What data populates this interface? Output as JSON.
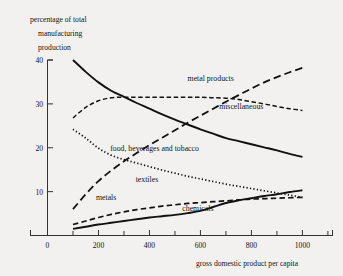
{
  "chart_data": {
    "type": "line",
    "title": "percentage of total manufacturing production",
    "title_lines": [
      "percentage of total",
      "manufacturing",
      "production"
    ],
    "xlabel": "gross domestic product per capita",
    "ylabel": "percentage of total manufacturing production",
    "xlim": [
      0,
      1120
    ],
    "ylim": [
      0,
      40
    ],
    "grid": false,
    "legend_position": "inline-annotations",
    "xticks": [
      0,
      200,
      400,
      600,
      800,
      1000
    ],
    "xtick_labels": [
      "0",
      "200",
      "400",
      "600",
      "800",
      "1000"
    ],
    "xminor_ticks": [
      100,
      300,
      500,
      700,
      900,
      1100
    ],
    "yticks": [
      0,
      10,
      20,
      30,
      40
    ],
    "ytick_labels": [
      "0",
      "10",
      "20",
      "30",
      "40"
    ],
    "x": [
      100,
      150,
      200,
      250,
      300,
      350,
      400,
      450,
      500,
      550,
      600,
      650,
      700,
      750,
      800,
      850,
      900,
      950,
      1000
    ],
    "series": [
      {
        "name": "food, beverages and tobacco",
        "label": "food, beverages and tobacco",
        "style": "solid",
        "values": [
          40.0,
          37.3,
          34.9,
          33.0,
          31.6,
          30.2,
          28.9,
          27.6,
          26.4,
          25.3,
          24.2,
          23.2,
          22.2,
          21.5,
          20.8,
          20.1,
          19.4,
          18.6,
          17.9
        ]
      },
      {
        "name": "miscellaneous",
        "label": "miscellaneous",
        "style": "dashed",
        "values": [
          26.8,
          29.2,
          30.7,
          31.4,
          31.5,
          31.5,
          31.5,
          31.5,
          31.5,
          31.5,
          31.5,
          31.4,
          31.3,
          31.0,
          30.5,
          30.0,
          29.4,
          28.9,
          28.5
        ]
      },
      {
        "name": "metal products",
        "label": "metal products",
        "style": "long-dash",
        "values": [
          6.0,
          9.4,
          12.4,
          14.8,
          16.9,
          18.8,
          20.6,
          22.3,
          24.0,
          25.7,
          27.3,
          28.9,
          30.5,
          32.0,
          33.5,
          34.9,
          36.1,
          37.2,
          38.2
        ]
      },
      {
        "name": "textiles",
        "label": "textiles",
        "style": "dotted",
        "values": [
          24.2,
          22.2,
          19.9,
          18.3,
          17.3,
          16.5,
          15.7,
          14.9,
          14.2,
          13.5,
          12.9,
          12.3,
          11.7,
          11.2,
          10.7,
          10.2,
          9.7,
          9.2,
          8.7
        ]
      },
      {
        "name": "metals",
        "label": "metals",
        "style": "medium-dash",
        "values": [
          2.5,
          3.3,
          4.1,
          4.8,
          5.4,
          5.9,
          6.3,
          6.7,
          7.0,
          7.3,
          7.5,
          7.7,
          7.9,
          8.1,
          8.3,
          8.4,
          8.5,
          8.6,
          8.7
        ]
      },
      {
        "name": "chemicals",
        "label": "chemicals",
        "style": "solid",
        "values": [
          1.5,
          2.0,
          2.5,
          2.9,
          3.3,
          3.7,
          4.1,
          4.4,
          4.7,
          5.1,
          5.6,
          6.5,
          7.4,
          8.0,
          8.5,
          9.0,
          9.4,
          9.9,
          10.3
        ]
      }
    ],
    "annotations": [
      {
        "text": "metal products",
        "x": 640,
        "y": 35.2
      },
      {
        "text": "miscellaneous",
        "x": 760,
        "y": 28.9
      },
      {
        "text": "food, beverages and tobacco",
        "x": 420,
        "y": 19.2
      },
      {
        "text": "textiles",
        "x": 390,
        "y": 12.1
      },
      {
        "text": "metals",
        "x": 230,
        "y": 8.1
      },
      {
        "text": "chemicals",
        "x": 590,
        "y": 5.5
      }
    ]
  }
}
